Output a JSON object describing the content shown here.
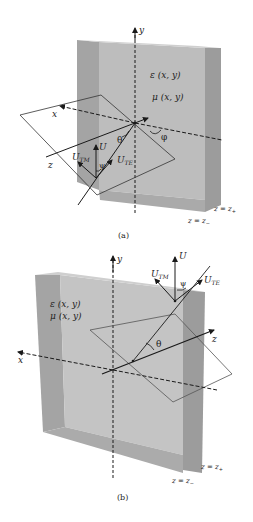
{
  "colors": {
    "slab_front": "#b9b9b9",
    "slab_side": "#9a9a9a",
    "slab_top": "#c8c8c8",
    "slab_inner": "#a8a8a8",
    "line": "#1a1a1a",
    "plane": "#555555",
    "background": "#ffffff"
  },
  "panel_a": {
    "caption": "(a)",
    "axis_y": "y",
    "axis_x": "x",
    "axis_z": "z",
    "epsilon": "ε (x, y)",
    "mu": "μ (x, y)",
    "vec_u": "U",
    "vec_utm": "U",
    "vec_utm_sub": "TM",
    "vec_ute": "U",
    "vec_ute_sub": "TE",
    "theta": "θ",
    "psi": "ψ",
    "phi": "φ",
    "z_plus": "z = z",
    "z_plus_sub": "+",
    "z_minus": "z = z",
    "z_minus_sub": "−"
  },
  "panel_b": {
    "caption": "(b)",
    "axis_y": "y",
    "axis_x": "x",
    "axis_z": "z",
    "epsilon": "ε (x, y)",
    "mu": "μ (x, y)",
    "vec_u": "U",
    "vec_utm": "U",
    "vec_utm_sub": "TM",
    "vec_ute": "U",
    "vec_ute_sub": "TE",
    "theta": "θ",
    "psi": "ψ",
    "z_plus": "z = z",
    "z_plus_sub": "+",
    "z_minus": "z = z",
    "z_minus_sub": "−"
  }
}
